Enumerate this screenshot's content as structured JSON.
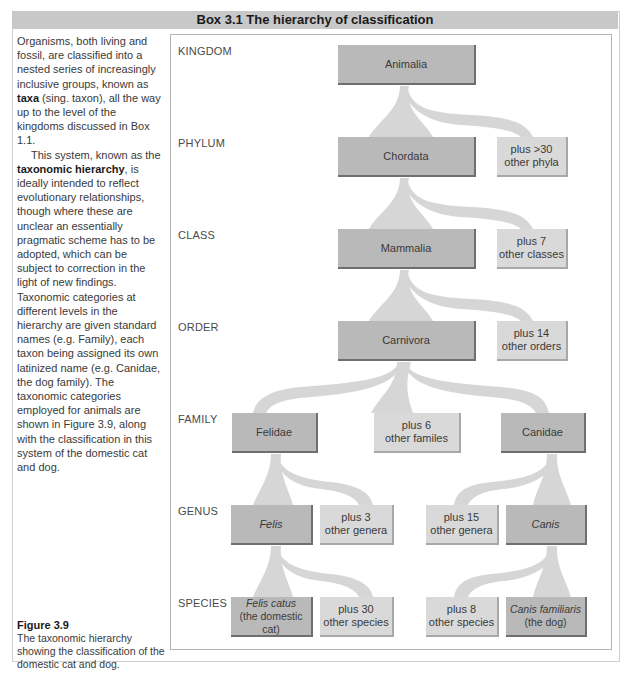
{
  "box": {
    "title": "Box 3.1  The hierarchy of classification"
  },
  "sidebar": {
    "p1_a": "Organisms, both living and fossil, are classified into a nested series of increasingly inclusive groups, known as ",
    "p1_term": "taxa",
    "p1_b": " (sing. taxon), all the way up to the level of the kingdoms discussed in Box 1.1.",
    "p2_a": "This system, known as the ",
    "p2_term": "taxonomic hierarchy",
    "p2_b": ", is ideally intended to reflect evolutionary relationships, though where these are unclear an essentially pragmatic scheme has to be adopted, which can be subject to correction in the light of new findings. Taxonomic categories at different levels in the hierarchy are given standard names (e.g. Family), each taxon being assigned its own latinized name (e.g. Canidae, the dog family). The taxonomic categories employed for animals are shown in Figure 3.9, along with the classification in this system of the domestic cat and dog."
  },
  "caption": {
    "figure_label": "Figure 3.9",
    "text": "The taxonomic hierarchy showing the classification of the domestic cat and dog."
  },
  "diagram": {
    "ranks": [
      "KINGDOM",
      "PHYLUM",
      "CLASS",
      "ORDER",
      "FAMILY",
      "GENUS",
      "SPECIES"
    ],
    "nodes": {
      "animalia": "Animalia",
      "chordata": "Chordata",
      "other_phyla": "plus >30\nother phyla",
      "mammalia": "Mammalia",
      "other_classes": "plus 7\nother classes",
      "carnivora": "Carnivora",
      "other_orders": "plus 14\nother orders",
      "felidae": "Felidae",
      "other_families": "plus 6\nother familes",
      "canidae": "Canidae",
      "felis": "Felis",
      "other_genera_cat": "plus 3\nother genera",
      "other_genera_dog": "plus 15\nother genera",
      "canis": "Canis",
      "felis_catus": "Felis catus\n(the domestic cat)",
      "other_species_cat": "plus 30\nother species",
      "other_species_dog": "plus 8\nother species",
      "canis_familiaris": "Canis familiaris\n(the dog)"
    },
    "colors": {
      "main_box": "#b9b9b9",
      "other_box": "#d9d9d9",
      "branch": "#d6d6d6",
      "header_bar": "#c8c8c8"
    }
  }
}
